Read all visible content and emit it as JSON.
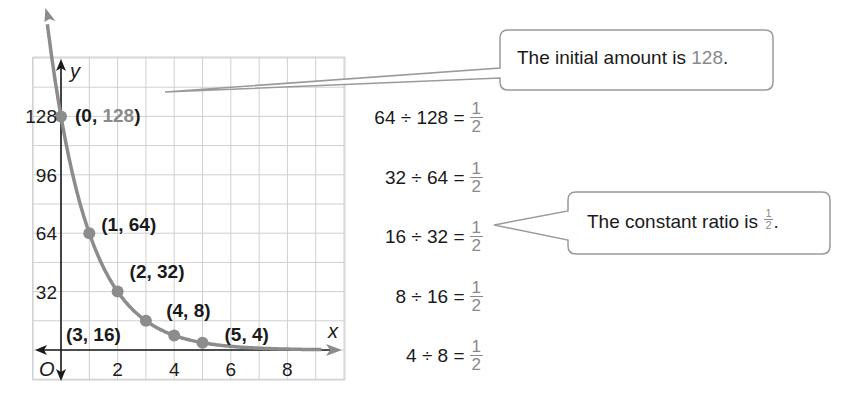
{
  "chart_data": {
    "type": "scatter",
    "title": "",
    "xlabel": "x",
    "ylabel": "y",
    "origin_label": "O",
    "x_ticks": [
      2,
      4,
      6,
      8
    ],
    "y_ticks": [
      32,
      64,
      96,
      128
    ],
    "xlim": [
      -1,
      10
    ],
    "ylim": [
      -8,
      136
    ],
    "grid": true,
    "series": [
      {
        "name": "y = 128(1/2)^x",
        "points": [
          {
            "x": 0,
            "y": 128,
            "label": "(0, 128)"
          },
          {
            "x": 1,
            "y": 64,
            "label": "(1, 64)"
          },
          {
            "x": 2,
            "y": 32,
            "label": "(2, 32)"
          },
          {
            "x": 3,
            "y": 16,
            "label": "(3, 16)"
          },
          {
            "x": 4,
            "y": 8,
            "label": "(4, 8)"
          },
          {
            "x": 5,
            "y": 4,
            "label": "(5, 4)"
          }
        ]
      }
    ],
    "ratios": [
      {
        "expr": "64 ÷ 128 =",
        "num": "1",
        "den": "2"
      },
      {
        "expr": "32 ÷ 64 =",
        "num": "1",
        "den": "2"
      },
      {
        "expr": "16 ÷ 32 =",
        "num": "1",
        "den": "2"
      },
      {
        "expr": "8 ÷ 16 =",
        "num": "1",
        "den": "2"
      },
      {
        "expr": "4 ÷ 8 =",
        "num": "1",
        "den": "2"
      }
    ],
    "annotations": [
      {
        "text_before": "The initial amount is ",
        "highlight": "128",
        "text_after": "."
      },
      {
        "text_before": "The constant ratio is ",
        "frac_num": "1",
        "frac_den": "2",
        "text_after": "."
      }
    ]
  },
  "colors": {
    "curve": "#8c8c8c",
    "grid": "#cfcfcf",
    "axis": "#1a1a1a",
    "highlight": "#8a8a8a",
    "callout_border": "#9a9a9a"
  }
}
